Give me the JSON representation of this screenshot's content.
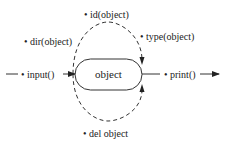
{
  "diagram": {
    "center_node": {
      "label": "object"
    },
    "inputs": [
      {
        "label": "• input()"
      }
    ],
    "outputs": [
      {
        "label": "• print()"
      }
    ],
    "operations": [
      {
        "label": "• dir(object)"
      },
      {
        "label": "• id(object)"
      },
      {
        "label": "• type(object)"
      },
      {
        "label": "• del object"
      }
    ],
    "colors": {
      "stroke": "#333333",
      "text": "#222222",
      "background": "#ffffff"
    }
  }
}
